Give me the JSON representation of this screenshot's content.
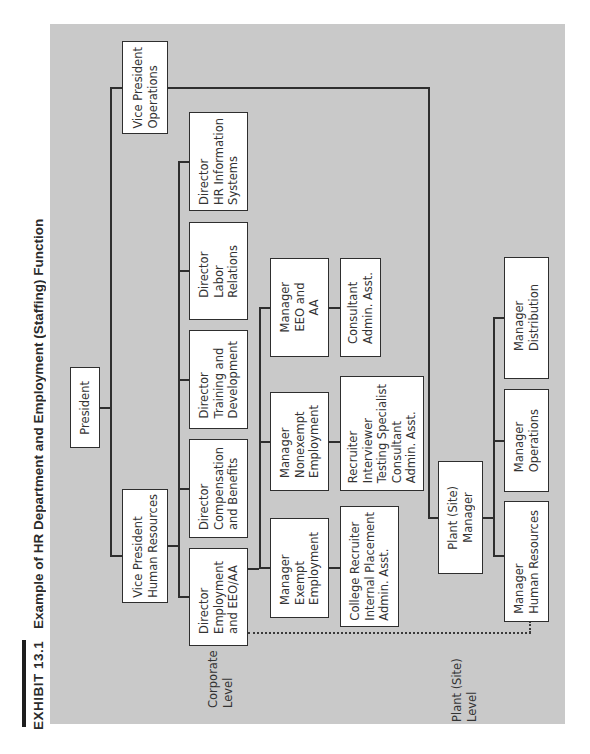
{
  "exhibit": {
    "number": "EXHIBIT 13.1",
    "title": "Example of HR Department and Employment (Staffing) Function"
  },
  "levels": {
    "corporate": "Corporate\nLevel",
    "plant": "Plant (Site)\nLevel"
  },
  "nodes": {
    "president": "President",
    "vp_hr": "Vice President\nHuman Resources",
    "vp_ops": "Vice President\nOperations",
    "dir_hris": "Director\nHR Information\nSystems",
    "dir_labor": "Director\nLabor\nRelations",
    "dir_training": "Director\nTraining and\nDevelopment",
    "dir_comp": "Director\nCompensation\nand Benefits",
    "dir_employment": "Director\nEmployment\nand EEO/AA",
    "mgr_eeo": "Manager\nEEO and\nAA",
    "mgr_nonexempt": "Manager\nNonexempt\nEmployment",
    "mgr_exempt": "Manager\nExempt\nEmployment",
    "staff_eeo": "Consultant\nAdmin. Asst.",
    "staff_nonexempt": "Recruiter\nInterviewer\nTesting Specialist\nConsultant\nAdmin. Asst.",
    "staff_exempt": "College Recruiter\nInternal Placement\nAdmin. Asst.",
    "plant_mgr": "Plant (Site)\nManager",
    "plant_mgr_distribution": "Manager\nDistribution",
    "plant_mgr_operations": "Manager\nOperations",
    "plant_mgr_hr": "Manager\nHuman Resources"
  }
}
